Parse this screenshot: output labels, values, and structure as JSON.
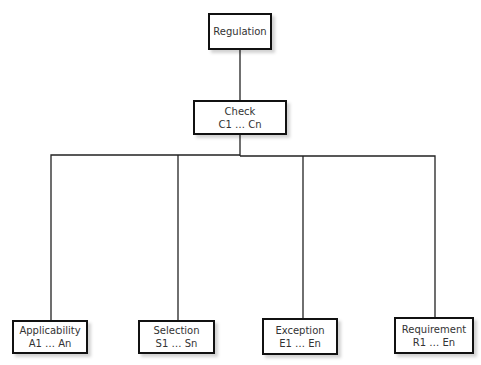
{
  "diagram": {
    "type": "hierarchy",
    "root": {
      "title": "Regulation"
    },
    "check": {
      "title": "Check",
      "range": "C1 … Cn"
    },
    "children": [
      {
        "title": "Applicability",
        "range": "A1 … An"
      },
      {
        "title": "Selection",
        "range": "S1 … Sn"
      },
      {
        "title": "Exception",
        "range": "E1 … En"
      },
      {
        "title": "Requirement",
        "range": "R1 … En"
      }
    ]
  }
}
